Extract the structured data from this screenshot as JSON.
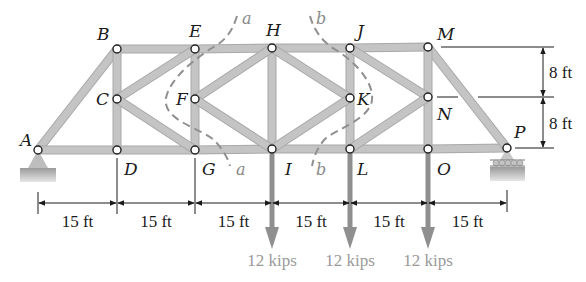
{
  "figure": {
    "type": "truss",
    "nodes": [
      {
        "id": "A",
        "x": 38,
        "y": 150,
        "lx": 20,
        "ly": 146
      },
      {
        "id": "B",
        "x": 117,
        "y": 49,
        "lx": 97,
        "ly": 40
      },
      {
        "id": "C",
        "x": 117,
        "y": 99,
        "lx": 96,
        "ly": 105
      },
      {
        "id": "D",
        "x": 117,
        "y": 150,
        "lx": 124,
        "ly": 175
      },
      {
        "id": "E",
        "x": 195,
        "y": 49,
        "lx": 189,
        "ly": 37
      },
      {
        "id": "F",
        "x": 195,
        "y": 99,
        "lx": 176,
        "ly": 105
      },
      {
        "id": "G",
        "x": 195,
        "y": 150,
        "lx": 202,
        "ly": 175
      },
      {
        "id": "H",
        "x": 272,
        "y": 48,
        "lx": 266,
        "ly": 36
      },
      {
        "id": "I",
        "x": 272,
        "y": 149,
        "lx": 285,
        "ly": 175
      },
      {
        "id": "J",
        "x": 350,
        "y": 48,
        "lx": 357,
        "ly": 37
      },
      {
        "id": "K",
        "x": 350,
        "y": 98,
        "lx": 357,
        "ly": 105
      },
      {
        "id": "L",
        "x": 350,
        "y": 149,
        "lx": 357,
        "ly": 175
      },
      {
        "id": "M",
        "x": 428,
        "y": 47,
        "lx": 437,
        "ly": 40
      },
      {
        "id": "N",
        "x": 428,
        "y": 97,
        "lx": 437,
        "ly": 120
      },
      {
        "id": "O",
        "x": 428,
        "y": 149,
        "lx": 437,
        "ly": 175
      },
      {
        "id": "P",
        "x": 507,
        "y": 148,
        "lx": 514,
        "ly": 138
      }
    ],
    "members": [
      [
        "A",
        "B"
      ],
      [
        "A",
        "D"
      ],
      [
        "D",
        "G"
      ],
      [
        "G",
        "I"
      ],
      [
        "I",
        "L"
      ],
      [
        "L",
        "O"
      ],
      [
        "O",
        "P"
      ],
      [
        "B",
        "E"
      ],
      [
        "E",
        "H"
      ],
      [
        "H",
        "J"
      ],
      [
        "J",
        "M"
      ],
      [
        "M",
        "P"
      ],
      [
        "B",
        "C"
      ],
      [
        "C",
        "D"
      ],
      [
        "E",
        "F"
      ],
      [
        "F",
        "G"
      ],
      [
        "H",
        "I"
      ],
      [
        "J",
        "K"
      ],
      [
        "K",
        "L"
      ],
      [
        "M",
        "N"
      ],
      [
        "N",
        "O"
      ],
      [
        "C",
        "E"
      ],
      [
        "C",
        "G"
      ],
      [
        "F",
        "H"
      ],
      [
        "F",
        "I"
      ],
      [
        "H",
        "K"
      ],
      [
        "I",
        "K"
      ],
      [
        "J",
        "N"
      ],
      [
        "L",
        "N"
      ]
    ],
    "cuts": [
      {
        "label": "a",
        "top_label": "a",
        "bottom_label": "a"
      },
      {
        "label": "b",
        "top_label": "b",
        "bottom_label": "b"
      }
    ],
    "horizontal_dims": {
      "spacing_label": "15 ft",
      "labels": [
        "15 ft",
        "15 ft",
        "15 ft",
        "15 ft",
        "15 ft",
        "15 ft"
      ]
    },
    "vertical_dims": {
      "labels": [
        "8 ft",
        "8 ft"
      ]
    },
    "loads": [
      {
        "at": "I",
        "label": "12 kips"
      },
      {
        "at": "L",
        "label": "12 kips"
      },
      {
        "at": "O",
        "label": "12 kips"
      }
    ],
    "supports": [
      {
        "at": "A",
        "type": "pin"
      },
      {
        "at": "P",
        "type": "roller"
      }
    ],
    "colors": {
      "member": "#c4c4c4",
      "member_edge": "#a8a8a8",
      "load_arrow": "#8f8f8f",
      "cut_line": "#909090",
      "support": "#bdbdbd"
    }
  }
}
